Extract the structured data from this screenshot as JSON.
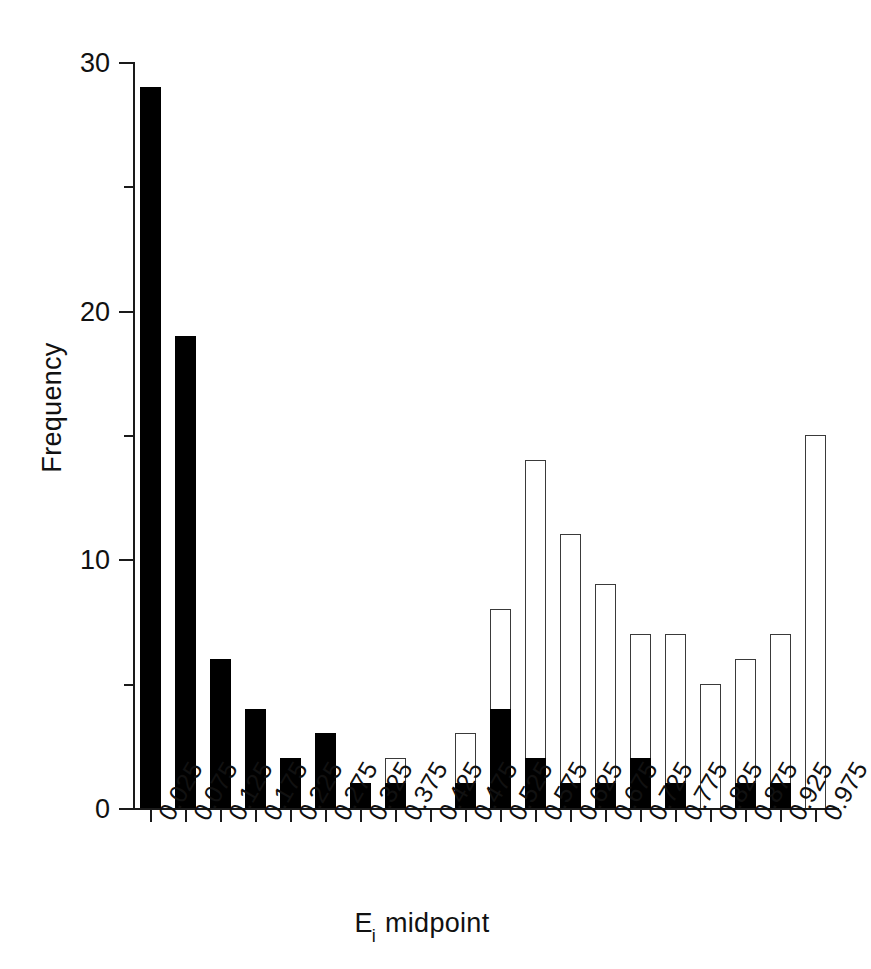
{
  "chart_data": {
    "type": "bar",
    "title": "",
    "subtitle": "",
    "xlabel": "E_i midpoint",
    "xlabel_base": "E",
    "xlabel_subscript": "i",
    "xlabel_suffix": " midpoint",
    "ylabel": "Frequency",
    "ylim": [
      0,
      30
    ],
    "xlim": [
      0.0,
      1.0
    ],
    "grid": false,
    "legend": "none",
    "stacked": true,
    "bar_style": "stacked two-segment: filled black lower segment, white open upper segment",
    "y_major_ticks": [
      0,
      10,
      20,
      30
    ],
    "y_major_tick_labels": [
      "0",
      "10",
      "20",
      "30"
    ],
    "y_minor_ticks": [
      5,
      15,
      25
    ],
    "categories": [
      "0.025",
      "0.075",
      "0.125",
      "0.175",
      "0.225",
      "0.275",
      "0.325",
      "0.375",
      "0.425",
      "0.475",
      "0.525",
      "0.575",
      "0.625",
      "0.675",
      "0.725",
      "0.775",
      "0.825",
      "0.875",
      "0.925",
      "0.975"
    ],
    "series": [
      {
        "name": "black",
        "color": "#000000",
        "values": [
          29,
          19,
          6,
          4,
          2,
          3,
          1,
          1,
          0,
          1,
          4,
          2,
          1,
          1,
          2,
          1,
          0,
          1,
          1,
          0
        ]
      },
      {
        "name": "white",
        "color": "#ffffff",
        "values": [
          0,
          0,
          0,
          0,
          0,
          0,
          0,
          1,
          0,
          2,
          4,
          12,
          10,
          8,
          5,
          6,
          5,
          5,
          6,
          15
        ]
      }
    ],
    "totals": [
      29,
      19,
      6,
      4,
      2,
      3,
      1,
      2,
      0,
      3,
      8,
      14,
      11,
      9,
      7,
      7,
      5,
      6,
      7,
      15
    ]
  },
  "axis_colors": {
    "axis": "#1a1a1a",
    "text": "#111111",
    "bar_black": "#000000",
    "bar_white_fill": "#ffffff",
    "bar_white_stroke": "#3a3a3a"
  }
}
